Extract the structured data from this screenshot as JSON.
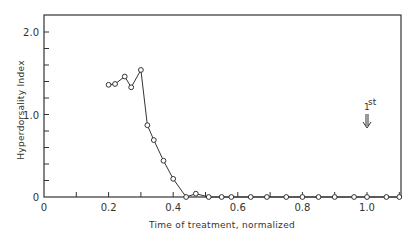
{
  "chart_data": {
    "type": "line",
    "title": "",
    "xlabel": "Time of treatment, normalized",
    "ylabel": "Hyperdorsality Index",
    "xlim": [
      0,
      1.1
    ],
    "ylim": [
      0,
      2.2
    ],
    "x_ticks": [
      0,
      0.2,
      0.4,
      0.6,
      0.8,
      1.0
    ],
    "x_tick_labels": [
      "0",
      "0.2",
      "0.4",
      "0.6",
      "0.8",
      "1.0"
    ],
    "y_ticks": [
      0,
      1.0,
      2.0
    ],
    "y_tick_labels": [
      "0",
      "1.0",
      "2.0"
    ],
    "grid": false,
    "legend": null,
    "marker": "open-circle",
    "series": [
      {
        "name": "Hyperdorsality Index",
        "x": [
          0.2,
          0.22,
          0.25,
          0.27,
          0.3,
          0.32,
          0.34,
          0.37,
          0.4,
          0.44,
          0.47,
          0.51,
          0.55,
          0.58,
          0.64,
          0.69,
          0.75,
          0.8,
          0.85,
          0.9,
          0.96,
          1.0,
          1.06,
          1.1
        ],
        "values": [
          1.36,
          1.37,
          1.46,
          1.33,
          1.54,
          0.87,
          0.69,
          0.44,
          0.22,
          0.0,
          0.04,
          0.0,
          0.0,
          0.0,
          0.0,
          0.0,
          0.0,
          0.0,
          0.0,
          0.0,
          0.0,
          0.0,
          0.0,
          0.0
        ]
      }
    ],
    "annotations": [
      {
        "text": "1st",
        "x": 1.0,
        "y": 0.95,
        "arrow": "down"
      }
    ]
  },
  "labels": {
    "x_axis": "Time of treatment, normalized",
    "y_axis": "Hyperdorsality Index",
    "annotation_main": "1",
    "annotation_sup": "st"
  }
}
